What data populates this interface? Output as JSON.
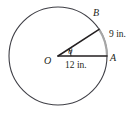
{
  "figure": {
    "type": "geometry-diagram",
    "colors": {
      "circle_stroke": "#3f3f46",
      "radius_stroke": "#231f20",
      "arc_highlight_stroke": "#a6a6a6",
      "text": "#231f20",
      "background": "#ffffff"
    },
    "geometry": {
      "center_x": 58,
      "center_y": 56,
      "radius_px": 49,
      "point_a_angle_deg": 0,
      "point_b_angle_deg": 33,
      "angle_marker_radius_px": 13
    },
    "labels": {
      "center": "O",
      "point_a": "A",
      "point_b": "B",
      "angle": "θ"
    },
    "measurements": {
      "radius_label": "12 in.",
      "arc_label": "9 in."
    }
  }
}
